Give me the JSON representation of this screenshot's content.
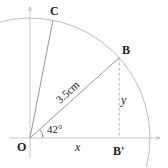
{
  "diagram": {
    "points": {
      "origin": "O",
      "b": "B",
      "b_projection": "B'",
      "c": "C"
    },
    "labels": {
      "radius": "3.5cm",
      "angle": "42°",
      "x": "x",
      "y": "y"
    },
    "angles_deg": {
      "OB": 42,
      "OC": 79
    },
    "radius_cm": 3.5,
    "colors": {
      "axis": "#b8b8b8",
      "line": "#999999",
      "arc": "#b0b0b0",
      "text": "#222222"
    }
  }
}
